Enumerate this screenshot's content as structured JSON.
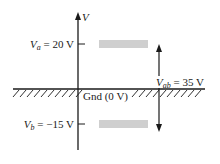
{
  "diagram": {
    "axis_label": "V",
    "ground": {
      "label": "Gnd (0 V)",
      "voltage_v": 0
    },
    "point_a": {
      "symbol": "V",
      "subscript": "a",
      "equals": "= 20 V",
      "voltage_v": 20
    },
    "point_b": {
      "symbol": "V",
      "subscript": "b",
      "equals": "= −15 V",
      "voltage_v": -15
    },
    "difference": {
      "symbol": "V",
      "subscript": "ab",
      "equals": "= 35 V",
      "voltage_v": 35
    },
    "colors": {
      "line": "#1a1a1a",
      "bar": "#cfcfcf",
      "background": "#ffffff"
    }
  }
}
